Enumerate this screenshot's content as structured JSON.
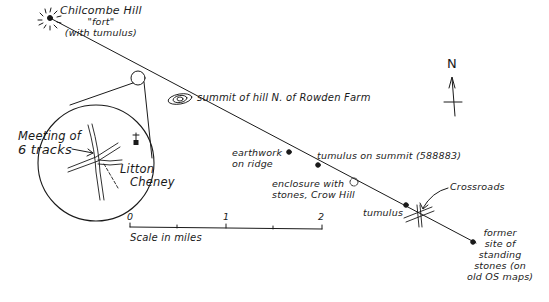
{
  "map": {
    "labels": {
      "chilcombe": [
        "Chilcombe Hill",
        "\"fort\"",
        "(with tumulus)"
      ],
      "rowden": "summit of hill N. of Rowden Farm",
      "meeting": [
        "Meeting of",
        "6 tracks"
      ],
      "litton": [
        "Litton",
        "Cheney"
      ],
      "earthwork": [
        "earthwork",
        "on ridge"
      ],
      "tumulus_summit": "tumulus on summit (588883)",
      "enclosure": [
        "enclosure with",
        "stones, Crow Hill"
      ],
      "crossroads": "Crossroads",
      "tumulus": "tumulus",
      "standing_stones": [
        "former",
        "site of",
        "standing",
        "stones (on",
        "old OS maps)"
      ],
      "north": "N"
    },
    "scale": {
      "ticks": [
        "0",
        "1",
        "2"
      ],
      "caption": "Scale in miles"
    },
    "ink_color": "#1a1a1a"
  }
}
